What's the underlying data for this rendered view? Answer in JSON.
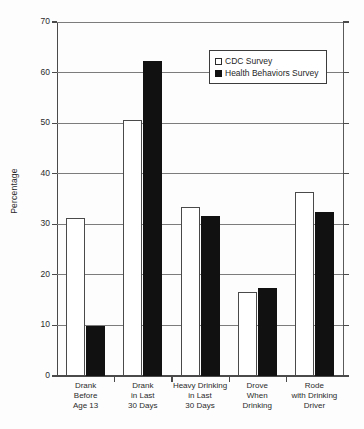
{
  "chart_data": {
    "type": "bar",
    "title": "",
    "xlabel": "",
    "ylabel": "Percentage",
    "ylim": [
      0,
      70
    ],
    "yticks": [
      0,
      10,
      20,
      30,
      40,
      50,
      60,
      70
    ],
    "grid": "horizontal",
    "legend_position": "upper-right-inside",
    "categories": [
      "Drank\nBefore\nAge 13",
      "Drank\nin Last\n30 Days",
      "Heavy Drinking\nin Last\n30 Days",
      "Drove\nWhen\nDrinking",
      "Rode\nwith Drinking\nDriver"
    ],
    "category_lines": [
      [
        "Drank",
        "Before",
        "Age 13"
      ],
      [
        "Drank",
        "in Last",
        "30 Days"
      ],
      [
        "Heavy Drinking",
        "in Last",
        "30 Days"
      ],
      [
        "Drove",
        "When",
        "Drinking"
      ],
      [
        "Rode",
        "with Drinking",
        "Driver"
      ]
    ],
    "series": [
      {
        "name": "CDC Survey",
        "color": "#ffffff",
        "edge_color": "#4a4a4a",
        "values": [
          31.2,
          50.6,
          33.4,
          16.7,
          36.4
        ]
      },
      {
        "name": "Health Behaviors Survey",
        "color": "#111111",
        "edge_color": "#111111",
        "values": [
          9.8,
          62.3,
          31.7,
          17.5,
          32.4
        ]
      }
    ]
  },
  "legend": {
    "items": [
      {
        "label": "CDC Survey",
        "swatch": "open-square"
      },
      {
        "label": "Health Behaviors Survey",
        "swatch": "filled-square"
      }
    ]
  },
  "axis": {
    "y_title": "Percentage",
    "y_tick_labels": [
      "70",
      "60",
      "50",
      "40",
      "30",
      "20",
      "10",
      "0"
    ]
  }
}
